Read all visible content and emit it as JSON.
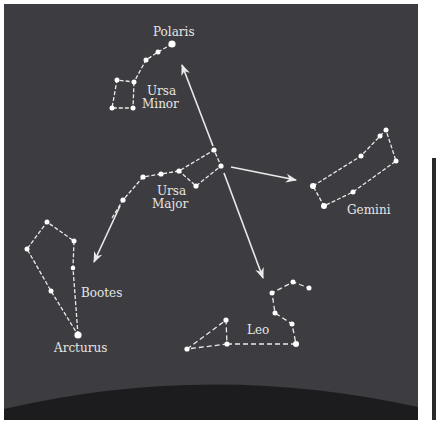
{
  "diagram": {
    "colors": {
      "sky": "#3d3d41",
      "horizon": "#1c1b1e",
      "lines": "#eaeaea",
      "stars": "#ffffff",
      "labels": "#e6e6e6"
    },
    "labels": {
      "polaris": "Polaris",
      "ursa_minor_1": "Ursa",
      "ursa_minor_2": "Minor",
      "ursa_major_1": "Ursa",
      "ursa_major_2": "Major",
      "gemini": "Gemini",
      "bootes": "Bootes",
      "arcturus": "Arcturus",
      "leo": "Leo"
    },
    "constellations": [
      {
        "name": "Ursa Minor",
        "bright_star": "Polaris"
      },
      {
        "name": "Ursa Major"
      },
      {
        "name": "Gemini"
      },
      {
        "name": "Bootes",
        "bright_star": "Arcturus"
      },
      {
        "name": "Leo"
      }
    ],
    "pointer_arrows": [
      {
        "from": "Ursa Major",
        "to": "Polaris"
      },
      {
        "from": "Ursa Major",
        "to": "Gemini"
      },
      {
        "from": "Ursa Major",
        "to": "Leo"
      },
      {
        "from": "Ursa Major",
        "to": "Bootes"
      }
    ]
  }
}
